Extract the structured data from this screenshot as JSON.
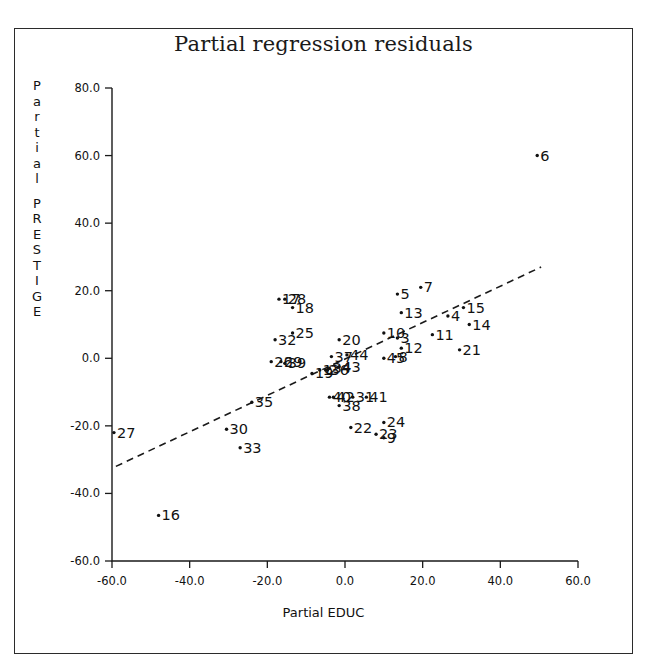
{
  "figure": {
    "title": "Partial regression residuals",
    "background": "#ffffff",
    "ink_color": "#1a1a1a"
  },
  "axes": {
    "ylabel_chars": [
      "P",
      "a",
      "r",
      "t",
      "i",
      "a",
      "l",
      "",
      "P",
      "R",
      "E",
      "S",
      "T",
      "I",
      "G",
      "E"
    ],
    "ylabel_text": "Partial PRESTIGE",
    "xlabel_text": "Partial EDUC"
  },
  "chart_data": {
    "type": "scatter",
    "title": "Partial regression residuals",
    "xlabel": "Partial EDUC",
    "ylabel": "Partial PRESTIGE",
    "xlim": [
      -60.0,
      60.0
    ],
    "ylim": [
      -60.0,
      80.0
    ],
    "xticks": [
      -60.0,
      -40.0,
      -20.0,
      0.0,
      20.0,
      40.0,
      60.0
    ],
    "yticks": [
      -60.0,
      -40.0,
      -20.0,
      0.0,
      20.0,
      40.0,
      60.0,
      80.0
    ],
    "xtick_labels": [
      "-60.0",
      "-40.0",
      "-20.0",
      "0.0",
      "20.0",
      "40.0",
      "60.0"
    ],
    "ytick_labels": [
      "-60.0",
      "-40.0",
      "-20.0",
      "0.0",
      "20.0",
      "40.0",
      "60.0",
      "80.0"
    ],
    "grid": false,
    "legend": null,
    "marker": "small-dot",
    "point_label_position": "right-of-marker",
    "fit_line": {
      "style": "dashed",
      "x": [
        -59.0,
        50.5
      ],
      "y": [
        -32.0,
        27.0
      ]
    },
    "points": [
      {
        "label": "1",
        "x": -6.5,
        "y": -3.5
      },
      {
        "label": "2",
        "x": -5.0,
        "y": -3.5
      },
      {
        "label": "3",
        "x": 13.5,
        "y": 6.0
      },
      {
        "label": "4",
        "x": 26.5,
        "y": 12.5
      },
      {
        "label": "5",
        "x": 13.5,
        "y": 19.0
      },
      {
        "label": "6",
        "x": 49.5,
        "y": 60.0
      },
      {
        "label": "7",
        "x": 19.5,
        "y": 21.0
      },
      {
        "label": "8",
        "x": 13.0,
        "y": 0.5
      },
      {
        "label": "9",
        "x": 10.0,
        "y": -23.5
      },
      {
        "label": "10",
        "x": 10.0,
        "y": 7.5
      },
      {
        "label": "11",
        "x": 22.5,
        "y": 7.0
      },
      {
        "label": "12",
        "x": 14.5,
        "y": 3.0
      },
      {
        "label": "13",
        "x": 14.5,
        "y": 13.5
      },
      {
        "label": "14",
        "x": 32.0,
        "y": 10.0
      },
      {
        "label": "15",
        "x": 30.5,
        "y": 15.0
      },
      {
        "label": "16",
        "x": -48.0,
        "y": -46.5
      },
      {
        "label": "17",
        "x": -17.0,
        "y": 17.5
      },
      {
        "label": "18",
        "x": -13.5,
        "y": 15.0
      },
      {
        "label": "19",
        "x": -8.5,
        "y": -4.5
      },
      {
        "label": "20",
        "x": -1.5,
        "y": 5.5
      },
      {
        "label": "21",
        "x": 29.5,
        "y": 2.5
      },
      {
        "label": "22",
        "x": 1.5,
        "y": -20.5
      },
      {
        "label": "23",
        "x": 8.0,
        "y": -22.5
      },
      {
        "label": "24",
        "x": 10.0,
        "y": -19.0
      },
      {
        "label": "25",
        "x": -13.5,
        "y": 7.5
      },
      {
        "label": "26",
        "x": -19.0,
        "y": -1.0
      },
      {
        "label": "27",
        "x": -59.5,
        "y": -22.0
      },
      {
        "label": "28",
        "x": -15.5,
        "y": 17.5
      },
      {
        "label": "29",
        "x": -16.5,
        "y": -1.0
      },
      {
        "label": "30",
        "x": -30.5,
        "y": -21.0
      },
      {
        "label": "31",
        "x": 2.0,
        "y": -11.5
      },
      {
        "label": "32",
        "x": -18.0,
        "y": 5.5
      },
      {
        "label": "33",
        "x": -27.0,
        "y": -26.5
      },
      {
        "label": "34",
        "x": -4.0,
        "y": -3.0
      },
      {
        "label": "35",
        "x": -24.0,
        "y": -13.0
      },
      {
        "label": "36",
        "x": -4.5,
        "y": -3.5
      },
      {
        "label": "37",
        "x": -3.5,
        "y": 0.5
      },
      {
        "label": "38",
        "x": -1.5,
        "y": -14.0
      },
      {
        "label": "39",
        "x": -15.5,
        "y": -1.5
      },
      {
        "label": "40",
        "x": -4.0,
        "y": -11.5
      },
      {
        "label": "41",
        "x": 5.5,
        "y": -11.5
      },
      {
        "label": "42",
        "x": -3.0,
        "y": -11.5
      },
      {
        "label": "43",
        "x": -1.5,
        "y": -2.5
      },
      {
        "label": "44",
        "x": 0.5,
        "y": 1.0
      },
      {
        "label": "45",
        "x": 10.0,
        "y": 0.0
      }
    ]
  }
}
